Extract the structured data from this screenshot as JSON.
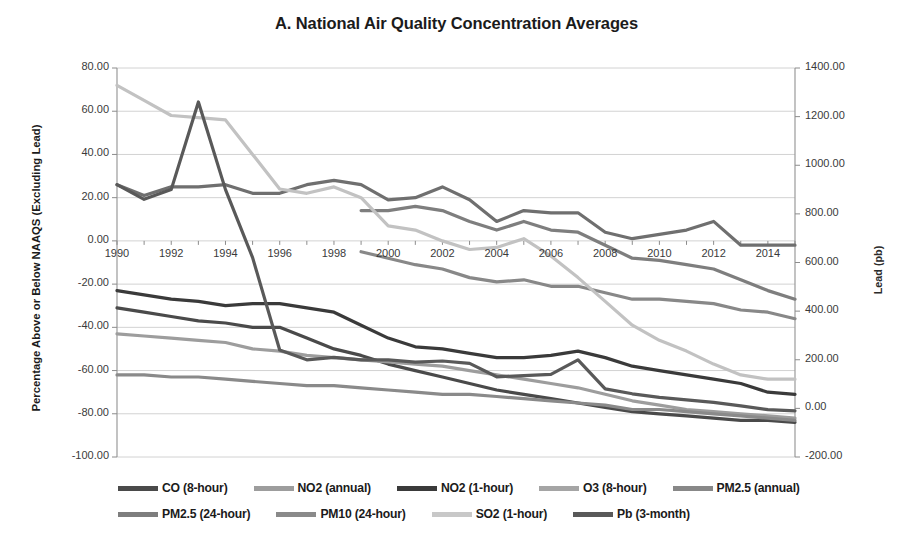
{
  "chart_data": {
    "type": "line",
    "title": "A. National Air Quality Concentration Averages",
    "xlabel": "",
    "ylabel": "Percentage Above or Below NAAQS (Excluding Lead)",
    "y2label": "Lead (pb)",
    "grid": true,
    "legend_position": "bottom",
    "xlim": [
      1990,
      2015
    ],
    "ylim": [
      -100,
      80
    ],
    "y2lim": [
      -200,
      1400
    ],
    "y_ticks": [
      80,
      60,
      40,
      20,
      0,
      -20,
      -40,
      -60,
      -80,
      -100
    ],
    "y_tick_labels": [
      "80.00",
      "60.00",
      "40.00",
      "20.00",
      "0.00",
      "-20.00",
      "-40.00",
      "-60.00",
      "-80.00",
      "-100.00"
    ],
    "y2_ticks": [
      1400,
      1200,
      1000,
      800,
      600,
      400,
      200,
      0,
      -200
    ],
    "y2_tick_labels": [
      "1400.00",
      "1200.00",
      "1000.00",
      "800.00",
      "600.00",
      "400.00",
      "200.00",
      "0.00",
      "-200.00"
    ],
    "x": [
      1990,
      1991,
      1992,
      1993,
      1994,
      1995,
      1996,
      1997,
      1998,
      1999,
      2000,
      2001,
      2002,
      2003,
      2004,
      2005,
      2006,
      2007,
      2008,
      2009,
      2010,
      2011,
      2012,
      2013,
      2014,
      2015
    ],
    "x_ticks": [
      1990,
      1992,
      1994,
      1996,
      1998,
      2000,
      2002,
      2004,
      2006,
      2008,
      2010,
      2012,
      2014
    ],
    "x_tick_labels": [
      "1990",
      "1992",
      "1994",
      "1996",
      "1998",
      "2000",
      "2002",
      "2004",
      "2006",
      "2008",
      "2010",
      "2012",
      "2014"
    ],
    "series": [
      {
        "name": "CO (8-hour)",
        "color": "#4a4a4a",
        "axis": "left",
        "values": [
          -31,
          -33,
          -35,
          -37,
          -38,
          -40,
          -40,
          -45,
          -50,
          -53,
          -57,
          -60,
          -63,
          -66,
          -69,
          -71,
          -73,
          -75,
          -77,
          -79,
          -80,
          -81,
          -82,
          -83,
          -83,
          -84
        ]
      },
      {
        "name": "NO2 (annual)",
        "color": "#9d9d9d",
        "axis": "left",
        "values": [
          -43,
          -44,
          -45,
          -46,
          -47,
          -50,
          -51,
          -53,
          -54,
          -55,
          -56,
          -57,
          -58,
          -60,
          -62,
          -64,
          -66,
          -68,
          -71,
          -74,
          -76,
          -78,
          -79,
          -80,
          -81,
          -82
        ]
      },
      {
        "name": "NO2 (1-hour)",
        "color": "#3a3a3a",
        "axis": "left",
        "values": [
          -23,
          -25,
          -27,
          -28,
          -30,
          -29,
          -29,
          -31,
          -33,
          -39,
          -45,
          -49,
          -50,
          -52,
          -54,
          -54,
          -53,
          -51,
          -54,
          -58,
          -60,
          -62,
          -64,
          -66,
          -70,
          -71
        ]
      },
      {
        "name": "O3 (8-hour)",
        "color": "#6f6f6f",
        "axis": "left",
        "values": [
          26,
          21,
          25,
          25,
          26,
          22,
          22,
          26,
          28,
          26,
          19,
          20,
          25,
          19,
          9,
          14,
          13,
          13,
          4,
          1,
          3,
          5,
          9,
          -2,
          -2,
          -2
        ]
      },
      {
        "name": "PM2.5 (annual)",
        "color": "#888888",
        "axis": "left",
        "values": [
          null,
          null,
          null,
          null,
          null,
          null,
          null,
          null,
          null,
          -5,
          -8,
          -11,
          -13,
          -17,
          -19,
          -18,
          -21,
          -21,
          -24,
          -27,
          -27,
          -28,
          -29,
          -32,
          -33,
          -36
        ]
      },
      {
        "name": "PM2.5 (24-hour)",
        "color": "#7e7e7e",
        "axis": "left",
        "values": [
          null,
          null,
          null,
          null,
          null,
          null,
          null,
          null,
          null,
          14,
          14,
          16,
          14,
          9,
          5,
          9,
          5,
          4,
          -2,
          -8,
          -9,
          -11,
          -13,
          -18,
          -23,
          -27
        ]
      },
      {
        "name": "PM10 (24-hour)",
        "color": "#8a8a8a",
        "axis": "left",
        "values": [
          -62,
          -62,
          -63,
          -63,
          -64,
          -65,
          -66,
          -67,
          -67,
          -68,
          -69,
          -70,
          -71,
          -71,
          -72,
          -73,
          -74,
          -75,
          -76,
          -78,
          -78,
          -79,
          -80,
          -81,
          -82,
          -83
        ]
      },
      {
        "name": "SO2 (1-hour)",
        "color": "#c2c2c2",
        "axis": "left",
        "values": [
          72,
          65,
          58,
          57,
          56,
          40,
          24,
          22,
          25,
          20,
          7,
          5,
          0,
          -4,
          -3,
          1,
          -7,
          -17,
          -28,
          -39,
          -46,
          -51,
          -57,
          -62,
          -64,
          -64
        ]
      },
      {
        "name": "Pb (3-month)",
        "color": "#595959",
        "axis": "right",
        "values": [
          920,
          860,
          900,
          1260,
          900,
          620,
          240,
          200,
          210,
          200,
          200,
          190,
          195,
          185,
          130,
          135,
          140,
          200,
          80,
          60,
          45,
          35,
          25,
          10,
          -5,
          -10
        ]
      }
    ]
  },
  "legend": {
    "rows": [
      [
        {
          "label": "CO (8-hour)",
          "color": "#4a4a4a"
        },
        {
          "label": "NO2 (annual)",
          "color": "#9d9d9d"
        },
        {
          "label": "NO2 (1-hour)",
          "color": "#3a3a3a"
        },
        {
          "label": "O3 (8-hour)",
          "color": "#a5a5a5"
        },
        {
          "label": "PM2.5 (annual)",
          "color": "#888888"
        }
      ],
      [
        {
          "label": "PM2.5 (24-hour)",
          "color": "#7e7e7e"
        },
        {
          "label": "PM10 (24-hour)",
          "color": "#8a8a8a"
        },
        {
          "label": "SO2 (1-hour)",
          "color": "#c8c8c8"
        },
        {
          "label": "Pb (3-month)",
          "color": "#595959"
        }
      ]
    ]
  }
}
